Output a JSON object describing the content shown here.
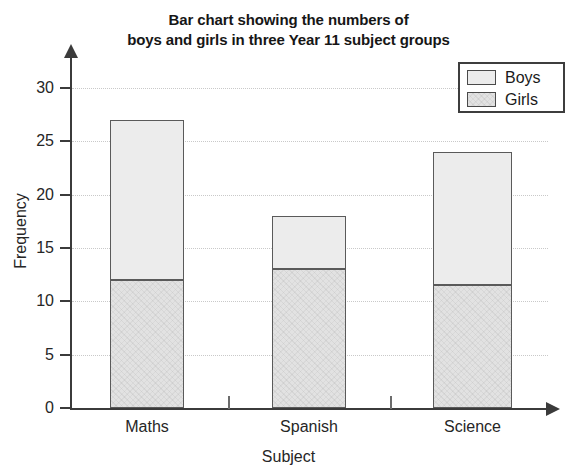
{
  "chart_data": {
    "type": "bar",
    "subtype": "stacked-bar",
    "title": "Bar chart showing the numbers of boys and girls in three Year 11 subject groups",
    "title_lines": [
      "Bar chart showing the numbers of",
      "boys and girls in three Year 11 subject groups"
    ],
    "xlabel": "Subject",
    "ylabel": "Frequency",
    "categories": [
      "Maths",
      "Spanish",
      "Science"
    ],
    "series": [
      {
        "name": "Girls",
        "values": [
          12,
          13,
          11.5
        ],
        "color": "#e2e2e2"
      },
      {
        "name": "Boys",
        "values": [
          15,
          5,
          12.5
        ],
        "color": "#ececec"
      }
    ],
    "totals": [
      27,
      18,
      24
    ],
    "ylim": [
      0,
      30
    ],
    "yticks": [
      0,
      5,
      10,
      15,
      20,
      25,
      30
    ],
    "ytick_labels": [
      "0",
      "5",
      "10",
      "15",
      "20",
      "25",
      "30"
    ],
    "grid": true,
    "grid_axis": "y",
    "legend_position": "top-right",
    "legend_entries": [
      "Boys",
      "Girls"
    ]
  },
  "legend": {
    "items": [
      {
        "label": "Boys",
        "swatch_name": "legend-swatch-boys"
      },
      {
        "label": "Girls",
        "swatch_name": "legend-swatch-girls"
      }
    ]
  },
  "colors": {
    "boys": "#ececec",
    "girls": "#e2e2e2",
    "axis": "#3b3b3b",
    "bar_outline": "#5a5a5a",
    "gridline": "#c9c9c9",
    "text": "#262626",
    "background": "#ffffff"
  }
}
